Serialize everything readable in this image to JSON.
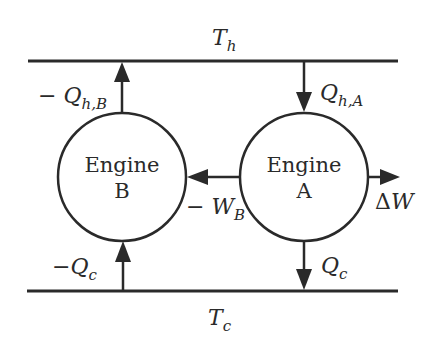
{
  "reservoirs": {
    "hot": {
      "label": "T",
      "subscript": "h"
    },
    "cold": {
      "label": "T",
      "subscript": "c"
    }
  },
  "engines": {
    "b": {
      "line1": "Engine",
      "line2": "B"
    },
    "a": {
      "line1": "Engine",
      "line2": "A"
    }
  },
  "flows": {
    "qhb": {
      "prefix": "− ",
      "symbol": "Q",
      "subscript": "h,B",
      "direction": "up"
    },
    "qha": {
      "prefix": "",
      "symbol": "Q",
      "subscript": "h,A",
      "direction": "down"
    },
    "wb": {
      "prefix": "− ",
      "symbol": "W",
      "subscript": "B",
      "direction": "left"
    },
    "dw": {
      "prefix": "Δ",
      "symbol": "W",
      "subscript": "",
      "direction": "right"
    },
    "qcb": {
      "prefix": "−",
      "symbol": "Q",
      "subscript": "c",
      "direction": "up"
    },
    "qca": {
      "prefix": "",
      "symbol": "Q",
      "subscript": "c",
      "direction": "down"
    }
  },
  "colors": {
    "ink": "#2a2a2a",
    "background": "#ffffff"
  }
}
